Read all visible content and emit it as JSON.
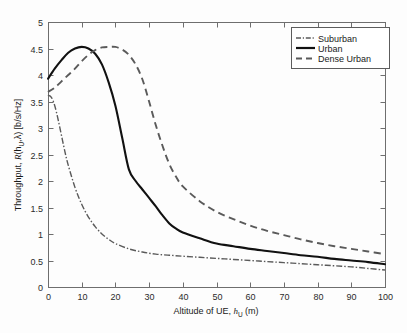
{
  "chart_data": {
    "type": "line",
    "title": "",
    "xlabel": "Altitude of UE, h_U (m)",
    "xlabel_main": "Altitude of UE, ",
    "xlabel_var": "h",
    "xlabel_sub": "U",
    "xlabel_unit": " (m)",
    "ylabel": "Throughput, R(h_U,λ) [b/s/Hz]",
    "ylabel_pre": "Throughput, ",
    "ylabel_var": "R",
    "ylabel_open": "(h",
    "ylabel_sub": "U",
    "ylabel_close": ",λ) [b/s/Hz]",
    "xlim": [
      0,
      100
    ],
    "ylim": [
      0,
      5
    ],
    "xticks": [
      0,
      10,
      20,
      30,
      40,
      50,
      60,
      70,
      80,
      90,
      100
    ],
    "yticks": [
      0,
      0.5,
      1,
      1.5,
      2,
      2.5,
      3,
      3.5,
      4,
      4.5,
      5
    ],
    "xtick_labels": [
      "0",
      "10",
      "20",
      "30",
      "40",
      "50",
      "60",
      "70",
      "80",
      "90",
      "100"
    ],
    "ytick_labels": [
      "0",
      "0.5",
      "1",
      "1.5",
      "2",
      "2.5",
      "3",
      "3.5",
      "4",
      "4.5",
      "5"
    ],
    "grid": false,
    "legend_position": "top-right",
    "series": [
      {
        "name": "Suburban",
        "style": "dash-dot",
        "color": "#5a5a5a",
        "x": [
          0,
          1,
          2,
          3,
          4,
          5,
          6,
          8,
          10,
          12,
          14,
          16,
          18,
          20,
          24,
          28,
          32,
          36,
          40,
          45,
          50,
          55,
          60,
          65,
          70,
          75,
          80,
          85,
          90,
          95,
          100
        ],
        "y": [
          3.62,
          3.58,
          3.42,
          3.16,
          2.86,
          2.56,
          2.3,
          1.88,
          1.56,
          1.32,
          1.14,
          1.0,
          0.9,
          0.82,
          0.72,
          0.66,
          0.62,
          0.6,
          0.58,
          0.56,
          0.54,
          0.52,
          0.5,
          0.48,
          0.46,
          0.44,
          0.42,
          0.4,
          0.38,
          0.35,
          0.32
        ]
      },
      {
        "name": "Urban",
        "style": "solid",
        "color": "#111111",
        "x": [
          0,
          2,
          4,
          6,
          8,
          10,
          12,
          14,
          16,
          18,
          20,
          22,
          24,
          26,
          28,
          30,
          32,
          34,
          36,
          38,
          40,
          45,
          50,
          55,
          60,
          65,
          70,
          75,
          80,
          85,
          90,
          95,
          100
        ],
        "y": [
          3.93,
          4.12,
          4.28,
          4.42,
          4.5,
          4.53,
          4.5,
          4.4,
          4.2,
          3.86,
          3.42,
          2.82,
          2.22,
          2.0,
          1.84,
          1.68,
          1.52,
          1.35,
          1.2,
          1.1,
          1.03,
          0.92,
          0.82,
          0.77,
          0.72,
          0.68,
          0.64,
          0.6,
          0.57,
          0.53,
          0.5,
          0.47,
          0.43
        ]
      },
      {
        "name": "Dense Urban",
        "style": "dashed",
        "color": "#5a5a5a",
        "x": [
          0,
          2,
          4,
          6,
          8,
          10,
          12,
          14,
          16,
          18,
          20,
          22,
          24,
          26,
          28,
          30,
          32,
          34,
          36,
          38,
          40,
          45,
          50,
          55,
          60,
          65,
          70,
          75,
          80,
          85,
          90,
          95,
          100
        ],
        "y": [
          3.68,
          3.76,
          3.88,
          4.0,
          4.12,
          4.26,
          4.38,
          4.47,
          4.52,
          4.53,
          4.53,
          4.48,
          4.38,
          4.2,
          3.92,
          3.5,
          3.05,
          2.66,
          2.32,
          2.08,
          1.9,
          1.62,
          1.42,
          1.28,
          1.16,
          1.06,
          0.98,
          0.9,
          0.83,
          0.77,
          0.72,
          0.67,
          0.62
        ]
      }
    ]
  },
  "legend": {
    "items": [
      {
        "label": "Suburban"
      },
      {
        "label": "Urban"
      },
      {
        "label": "Dense Urban"
      }
    ]
  }
}
